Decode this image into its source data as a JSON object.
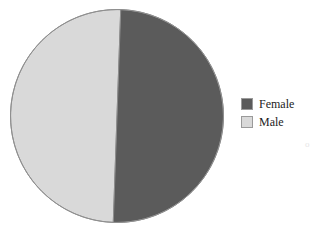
{
  "chart_data": {
    "type": "pie",
    "title": "",
    "subtitle": "",
    "xlabel": "",
    "ylabel": "",
    "grid": false,
    "legend_position": "right",
    "start_angle_deg": 2,
    "direction": "clockwise",
    "categories": [
      "Female",
      "Male"
    ],
    "values": [
      50,
      50
    ],
    "slices": [
      {
        "label": "Female",
        "value": 50,
        "percent": 50,
        "color": "#5b5b5b",
        "position": "right-half"
      },
      {
        "label": "Male",
        "value": 50,
        "percent": 50,
        "color": "#d9d9d9",
        "position": "left-half"
      }
    ],
    "colors": [
      "#5b5b5b",
      "#d9d9d9"
    ],
    "annotations": []
  },
  "legend": {
    "entries": [
      {
        "label": "Female",
        "swatch_color": "#5b5b5b",
        "swatch_border": "#9a9a9a"
      },
      {
        "label": "Male",
        "swatch_color": "#d9d9d9",
        "swatch_border": "#9a9a9a"
      }
    ]
  },
  "canvas": {
    "background": "#ffffff",
    "pie_outline_color": "#8f8f8f"
  },
  "artifact": {
    "mark": "o"
  }
}
